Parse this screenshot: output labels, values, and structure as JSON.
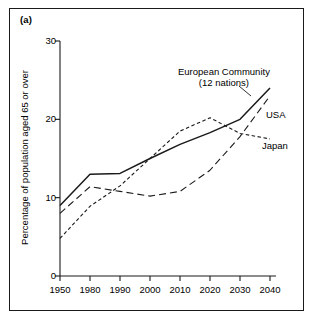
{
  "figure": {
    "panel_label": "(a)",
    "ylabel": "Percentage of population aged 65 or over"
  },
  "chart_data": {
    "type": "line",
    "title": "",
    "xlabel": "",
    "ylabel": "Percentage of population aged 65 or over",
    "x": [
      1950,
      1980,
      1990,
      2000,
      2010,
      2020,
      2030,
      2040
    ],
    "xticklabels": [
      "1950",
      "1980",
      "1990",
      "2000",
      "2010",
      "2020",
      "2030",
      "2040"
    ],
    "yticks": [
      0,
      10,
      20,
      30
    ],
    "yticklabels": [
      "0",
      "10",
      "20",
      "30"
    ],
    "ylim": [
      0,
      30
    ],
    "grid": false,
    "legend": "inline-annotations",
    "series": [
      {
        "name": "European Community (12 nations)",
        "style": "solid",
        "values": [
          9.0,
          13.0,
          13.1,
          15.0,
          16.8,
          18.3,
          20.0,
          24.0
        ]
      },
      {
        "name": "USA",
        "style": "long-dash",
        "values": [
          8.0,
          11.4,
          10.8,
          10.2,
          10.8,
          13.5,
          17.8,
          23.0
        ]
      },
      {
        "name": "Japan",
        "style": "short-dash",
        "values": [
          4.8,
          8.9,
          11.5,
          15.0,
          18.5,
          20.2,
          18.2,
          17.5
        ]
      }
    ],
    "annotations": [
      {
        "name": "european-community-label",
        "text_line1": "European Community",
        "text_line2": "(12 nations)"
      },
      {
        "name": "usa-label",
        "text": "USA"
      },
      {
        "name": "japan-label",
        "text": "Japan"
      }
    ]
  }
}
